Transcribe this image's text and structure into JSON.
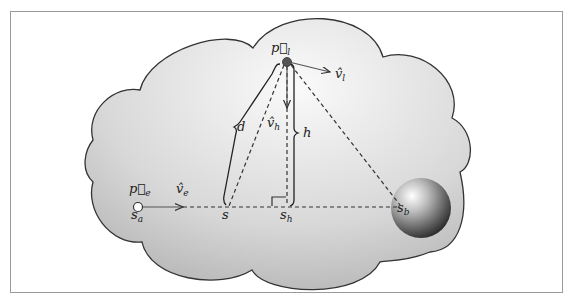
{
  "figure": {
    "colors": {
      "frame": "#9a9a9a",
      "cloud_outline": "#333333",
      "cloud_fill_light": "#f7f7f7",
      "cloud_fill_dark": "#b4b4b4",
      "line": "#333333",
      "light_point": "#555555"
    },
    "labels": {
      "p_e": "p⃗",
      "p_e_sub": "e",
      "s_a": "s",
      "s_a_sub": "a",
      "v_e": "v̂",
      "v_e_sub": "e",
      "s": "s",
      "s_h": "s",
      "s_h_sub": "h",
      "s_b": "s",
      "s_b_sub": "b",
      "p_l": "p⃗",
      "p_l_sub": "l",
      "v_l": "v̂",
      "v_l_sub": "l",
      "v_h": "v̂",
      "v_h_sub": "h",
      "d": "d",
      "h": "h"
    }
  }
}
